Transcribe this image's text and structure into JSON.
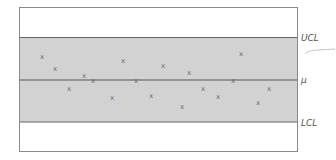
{
  "chart_data": {
    "type": "scatter",
    "title": "",
    "subtitle": "",
    "xlabel": "",
    "ylabel": "",
    "grid": false,
    "legend": null,
    "marker_glyph": "x",
    "control_limits": {
      "ucl_label": "UCL",
      "center_label": "μ",
      "lcl_label": "LCL",
      "ucl": 1,
      "center": 0,
      "lcl": -1
    },
    "ylim": [
      -1.7,
      1.7
    ],
    "x": [
      1,
      2,
      3,
      4,
      5,
      6,
      7,
      8,
      9,
      10,
      11,
      12,
      13,
      14,
      15,
      16,
      17,
      18,
      19
    ],
    "values": [
      0.57,
      0.28,
      -0.19,
      0.12,
      0.0,
      -0.4,
      0.47,
      0.0,
      -0.35,
      0.35,
      -0.61,
      0.19,
      -0.19,
      -0.38,
      0.0,
      0.64,
      -0.52,
      -0.19,
      0.0
    ],
    "points_px": [
      [
        42,
        56
      ],
      [
        55,
        68
      ],
      [
        69,
        88
      ],
      [
        84,
        75
      ],
      [
        93,
        80
      ],
      [
        112,
        97
      ],
      [
        123,
        60
      ],
      [
        136,
        80
      ],
      [
        151,
        95
      ],
      [
        163,
        65
      ],
      [
        182,
        106
      ],
      [
        189,
        72
      ],
      [
        203,
        88
      ],
      [
        218,
        96
      ],
      [
        233,
        80
      ],
      [
        241,
        53
      ],
      [
        258,
        102
      ],
      [
        269,
        88
      ]
    ]
  },
  "colors": {
    "band": "#d2d2d2",
    "line": "#555555",
    "frame": "#8a8a8a",
    "marker": "#6a6a6a",
    "label": "#555555"
  }
}
